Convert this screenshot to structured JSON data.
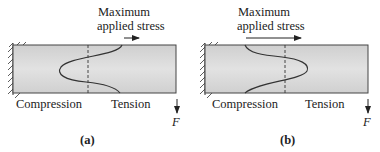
{
  "figure": {
    "panels": [
      {
        "id": "a",
        "caption": "(a)",
        "title_line1": "Maximum",
        "title_line2": "applied stress",
        "left_label": "Compression",
        "right_label": "Tension",
        "force_label": "F",
        "stress_profile": "bulges toward compression side"
      },
      {
        "id": "b",
        "caption": "(b)",
        "title_line1": "Maximum",
        "title_line2": "applied stress",
        "left_label": "Compression",
        "right_label": "Tension",
        "force_label": "F",
        "stress_profile": "bulges toward tension side"
      }
    ],
    "colors": {
      "beam_fill_light": "#e4e4e4",
      "beam_fill_dark": "#c4c4c4",
      "outline": "#3a3a3a"
    }
  }
}
